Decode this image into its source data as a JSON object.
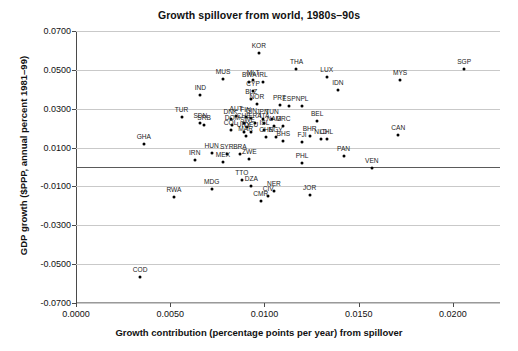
{
  "chart_data": {
    "type": "scatter",
    "title": "Growth spillover from world, 1980s–90s",
    "xlabel": "Growth contribution (percentage points per year) from spillover",
    "ylabel": "GDP growth ($PPP, annual percent 1981–99)",
    "xlim": [
      0.0,
      0.0225
    ],
    "ylim": [
      -0.07,
      0.07
    ],
    "xticks": [
      "0.0000",
      "0.0050",
      "0.0100",
      "0.0150",
      "0.0200"
    ],
    "xtick_values": [
      0.0,
      0.005,
      0.01,
      0.015,
      0.02
    ],
    "yticks": [
      "0.0700",
      "0.0500",
      "0.0300",
      "0.0100",
      "-0.0100",
      "-0.0300",
      "-0.0500",
      "-0.0700"
    ],
    "ytick_values": [
      0.07,
      0.05,
      0.03,
      0.01,
      -0.01,
      -0.03,
      -0.05,
      -0.07
    ],
    "grid": true,
    "zero_line": true,
    "legend": "none",
    "marker_color": "#000000",
    "points": [
      {
        "label": "SGP",
        "x": 0.0206,
        "y": 0.0505
      },
      {
        "label": "KOR",
        "x": 0.0097,
        "y": 0.0585
      },
      {
        "label": "THA",
        "x": 0.0117,
        "y": 0.0505
      },
      {
        "label": "LUX",
        "x": 0.0133,
        "y": 0.0463
      },
      {
        "label": "MYS",
        "x": 0.0172,
        "y": 0.045
      },
      {
        "label": "MUS",
        "x": 0.0078,
        "y": 0.0455
      },
      {
        "label": "MLT",
        "x": 0.0094,
        "y": 0.0448
      },
      {
        "label": "BWA",
        "x": 0.0092,
        "y": 0.044
      },
      {
        "label": "IRL",
        "x": 0.0099,
        "y": 0.044
      },
      {
        "label": "IDN",
        "x": 0.0139,
        "y": 0.0395
      },
      {
        "label": "CYP",
        "x": 0.0094,
        "y": 0.0392
      },
      {
        "label": "IND",
        "x": 0.0066,
        "y": 0.037
      },
      {
        "label": "BLZ",
        "x": 0.0093,
        "y": 0.0352
      },
      {
        "label": "NOR",
        "x": 0.0096,
        "y": 0.0322
      },
      {
        "label": "PRT",
        "x": 0.0108,
        "y": 0.0318
      },
      {
        "label": "ESP",
        "x": 0.0113,
        "y": 0.0315
      },
      {
        "label": "NPL",
        "x": 0.012,
        "y": 0.0312
      },
      {
        "label": "CAN",
        "x": 0.0171,
        "y": 0.0165
      },
      {
        "label": "BEL",
        "x": 0.0128,
        "y": 0.0235
      },
      {
        "label": "TUR",
        "x": 0.0056,
        "y": 0.0258
      },
      {
        "label": "SDN",
        "x": 0.0066,
        "y": 0.0225
      },
      {
        "label": "SRB",
        "x": 0.0068,
        "y": 0.0218
      },
      {
        "label": "AUT",
        "x": 0.0085,
        "y": 0.0262
      },
      {
        "label": "DNK",
        "x": 0.0082,
        "y": 0.0248
      },
      {
        "label": "FIN",
        "x": 0.009,
        "y": 0.0258
      },
      {
        "label": "GIN",
        "x": 0.0093,
        "y": 0.0252
      },
      {
        "label": "JPN",
        "x": 0.0099,
        "y": 0.0245
      },
      {
        "label": "TUN",
        "x": 0.0104,
        "y": 0.0248
      },
      {
        "label": "CHE",
        "x": 0.0089,
        "y": 0.0228
      },
      {
        "label": "FRA",
        "x": 0.0095,
        "y": 0.0225
      },
      {
        "label": "ITA",
        "x": 0.01,
        "y": 0.0228
      },
      {
        "label": "DOM",
        "x": 0.0083,
        "y": 0.0215
      },
      {
        "label": "SWE",
        "x": 0.0091,
        "y": 0.0208
      },
      {
        "label": "NAM",
        "x": 0.0105,
        "y": 0.0212
      },
      {
        "label": "GRC",
        "x": 0.011,
        "y": 0.021
      },
      {
        "label": "COL",
        "x": 0.0082,
        "y": 0.0188
      },
      {
        "label": "URY",
        "x": 0.0089,
        "y": 0.0182
      },
      {
        "label": "ISL",
        "x": 0.01,
        "y": 0.0188
      },
      {
        "label": "DEU",
        "x": 0.0093,
        "y": 0.0178
      },
      {
        "label": "MAR",
        "x": 0.009,
        "y": 0.0158
      },
      {
        "label": "CHN",
        "x": 0.0101,
        "y": 0.0152
      },
      {
        "label": "EGY",
        "x": 0.0106,
        "y": 0.0155
      },
      {
        "label": "BHS",
        "x": 0.011,
        "y": 0.0135
      },
      {
        "label": "BHR",
        "x": 0.0124,
        "y": 0.0158
      },
      {
        "label": "NLD",
        "x": 0.013,
        "y": 0.0145
      },
      {
        "label": "CHL",
        "x": 0.0133,
        "y": 0.0142
      },
      {
        "label": "FJI",
        "x": 0.012,
        "y": 0.0128
      },
      {
        "label": "GHA",
        "x": 0.0036,
        "y": 0.0118
      },
      {
        "label": "HUN",
        "x": 0.0072,
        "y": 0.0072
      },
      {
        "label": "SYR",
        "x": 0.008,
        "y": 0.0068
      },
      {
        "label": "BRA",
        "x": 0.0087,
        "y": 0.0068
      },
      {
        "label": "IRN",
        "x": 0.0063,
        "y": 0.0035
      },
      {
        "label": "MEX",
        "x": 0.0078,
        "y": 0.0028
      },
      {
        "label": "ZWE",
        "x": 0.0092,
        "y": 0.004
      },
      {
        "label": "PHL",
        "x": 0.012,
        "y": 0.002
      },
      {
        "label": "PAN",
        "x": 0.0142,
        "y": 0.0055
      },
      {
        "label": "VEN",
        "x": 0.0157,
        "y": -0.0005
      },
      {
        "label": "MDG",
        "x": 0.0072,
        "y": -0.0115
      },
      {
        "label": "TTO",
        "x": 0.0088,
        "y": -0.0065
      },
      {
        "label": "DZA",
        "x": 0.0093,
        "y": -0.0098
      },
      {
        "label": "CIV",
        "x": 0.0102,
        "y": -0.0148
      },
      {
        "label": "NER",
        "x": 0.0105,
        "y": -0.0122
      },
      {
        "label": "CMR",
        "x": 0.0098,
        "y": -0.0175
      },
      {
        "label": "JOR",
        "x": 0.0124,
        "y": -0.0145
      },
      {
        "label": "RWA",
        "x": 0.0052,
        "y": -0.0152
      },
      {
        "label": "COD",
        "x": 0.0034,
        "y": -0.0565
      }
    ]
  }
}
